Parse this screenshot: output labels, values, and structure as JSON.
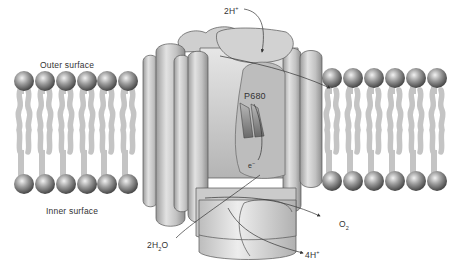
{
  "diagram": {
    "labels": {
      "outer_surface": "Outer surface",
      "inner_surface": "Inner surface",
      "proton_in": "2H",
      "proton_in_sup": "+",
      "reaction_center": "P680",
      "electron": "e",
      "electron_sup": "−",
      "oxygen": "O",
      "oxygen_sub": "2",
      "water": "2H",
      "water_sub": "2",
      "water_tail": "O",
      "proton_out": "4H",
      "proton_out_sup": "+"
    },
    "lipids": {
      "left_count": 6,
      "right_count": 6
    },
    "colors": {
      "lipid_head": "#7a7a7a",
      "lipid_tail": "#c4c4c4",
      "protein": "#d6d6d6",
      "protein_edge": "#555555",
      "chlorophyll": "#8a8a8a"
    }
  }
}
